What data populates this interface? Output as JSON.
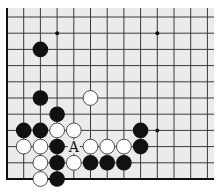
{
  "board": {
    "description": "Go problem diagram (partial board, lower-left corner region)",
    "colors": {
      "background": "#ebebeb",
      "line": "#3a3a3a",
      "edge": "#111111",
      "black_stone": "#111111",
      "white_stone": "#ffffff",
      "stone_outline": "#222222"
    },
    "grid": {
      "columns": 13,
      "rows": 11,
      "origin_x": 7,
      "origin_y": 17,
      "spacing_x": 16.7,
      "spacing_y": 16.2,
      "left_edge": true,
      "bottom_edge": true
    },
    "star_points": [
      {
        "col": 3,
        "row": 1
      },
      {
        "col": 9,
        "row": 1
      },
      {
        "col": 9,
        "row": 7
      }
    ],
    "stones": [
      {
        "color": "black",
        "col": 2,
        "row": 2
      },
      {
        "color": "black",
        "col": 2,
        "row": 5
      },
      {
        "color": "white",
        "col": 5,
        "row": 5
      },
      {
        "color": "black",
        "col": 3,
        "row": 6
      },
      {
        "color": "black",
        "col": 1,
        "row": 7
      },
      {
        "color": "black",
        "col": 2,
        "row": 7
      },
      {
        "color": "white",
        "col": 3,
        "row": 7
      },
      {
        "color": "white",
        "col": 4,
        "row": 7
      },
      {
        "color": "black",
        "col": 8,
        "row": 7
      },
      {
        "color": "white",
        "col": 1,
        "row": 8
      },
      {
        "color": "white",
        "col": 2,
        "row": 8
      },
      {
        "color": "black",
        "col": 3,
        "row": 8
      },
      {
        "color": "white",
        "col": 5,
        "row": 8
      },
      {
        "color": "white",
        "col": 6,
        "row": 8
      },
      {
        "color": "white",
        "col": 7,
        "row": 8
      },
      {
        "color": "black",
        "col": 8,
        "row": 8
      },
      {
        "color": "white",
        "col": 2,
        "row": 9
      },
      {
        "color": "black",
        "col": 3,
        "row": 9
      },
      {
        "color": "white",
        "col": 4,
        "row": 9
      },
      {
        "color": "black",
        "col": 5,
        "row": 9
      },
      {
        "color": "black",
        "col": 6,
        "row": 9
      },
      {
        "color": "black",
        "col": 7,
        "row": 9
      },
      {
        "color": "white",
        "col": 2,
        "row": 10
      },
      {
        "color": "black",
        "col": 3,
        "row": 10
      }
    ],
    "labels": [
      {
        "text": "A",
        "col": 4,
        "row": 8
      }
    ]
  }
}
